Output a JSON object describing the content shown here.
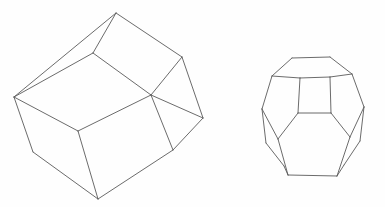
{
  "figure": {
    "title": "Two wireframe polyhedra line drawing",
    "background_color": "#fefefe",
    "stroke_color": "#5a5a5a",
    "stroke_width": 0.9,
    "width": 385,
    "height": 207,
    "shape_count": 2
  },
  "shapes": [
    {
      "id": "left-polyhedron",
      "name": "truncated-cube-wireframe",
      "label": "Left polyhedron",
      "description": "Large tilted truncated-cube / rhombic solid seen in three-quarter view",
      "bounds": {
        "x": 12,
        "y": 11,
        "width": 195,
        "height": 190
      },
      "face_count_visible": 6,
      "vertices": [
        {
          "id": "v-apex-top",
          "x": 116,
          "y": 13
        },
        {
          "id": "v-left-upper",
          "x": 14,
          "y": 97
        },
        {
          "id": "v-upper-mid",
          "x": 93,
          "y": 53
        },
        {
          "id": "v-right-upper",
          "x": 182,
          "y": 57
        },
        {
          "id": "v-center",
          "x": 151,
          "y": 95
        },
        {
          "id": "v-right-lower",
          "x": 203,
          "y": 118
        },
        {
          "id": "v-left-lower",
          "x": 33,
          "y": 152
        },
        {
          "id": "v-bottom-apex",
          "x": 98,
          "y": 199
        },
        {
          "id": "v-right-bottom",
          "x": 173,
          "y": 150
        },
        {
          "id": "v-inner-left",
          "x": 78,
          "y": 131
        }
      ],
      "faces": [
        {
          "id": "face-top-small",
          "name": "top-triangular-face",
          "path": "M 116 13 L 93 53 L 14 97 L 116 13 Z"
        },
        {
          "id": "face-top-large",
          "name": "top-rhombic-face",
          "path": "M 116 13 L 182 57 L 151 95 L 93 53 Z"
        },
        {
          "id": "face-left",
          "name": "left-rhombic-face",
          "path": "M 14 97 L 93 53 L 151 95 L 78 131 Z"
        },
        {
          "id": "face-front-left",
          "name": "front-left-face",
          "path": "M 14 97 L 78 131 L 98 199 L 33 152 Z"
        },
        {
          "id": "face-front-right",
          "name": "front-right-face",
          "path": "M 78 131 L 151 95 L 173 150 L 98 199 Z"
        },
        {
          "id": "face-right",
          "name": "right-rhombic-face",
          "path": "M 151 95 L 182 57 L 203 118 L 173 150 Z"
        }
      ],
      "edges": [
        {
          "from": "v-apex-top",
          "to": "v-upper-mid"
        },
        {
          "from": "v-apex-top",
          "to": "v-left-upper"
        },
        {
          "from": "v-apex-top",
          "to": "v-right-upper"
        },
        {
          "from": "v-upper-mid",
          "to": "v-left-upper"
        },
        {
          "from": "v-upper-mid",
          "to": "v-center"
        },
        {
          "from": "v-right-upper",
          "to": "v-center"
        },
        {
          "from": "v-right-upper",
          "to": "v-right-lower"
        },
        {
          "from": "v-center",
          "to": "v-right-lower"
        },
        {
          "from": "v-center",
          "to": "v-inner-left"
        },
        {
          "from": "v-left-upper",
          "to": "v-inner-left"
        },
        {
          "from": "v-left-upper",
          "to": "v-left-lower"
        },
        {
          "from": "v-inner-left",
          "to": "v-bottom-apex"
        },
        {
          "from": "v-left-lower",
          "to": "v-bottom-apex"
        },
        {
          "from": "v-bottom-apex",
          "to": "v-right-bottom"
        },
        {
          "from": "v-right-bottom",
          "to": "v-center"
        },
        {
          "from": "v-right-bottom",
          "to": "v-right-lower"
        }
      ]
    },
    {
      "id": "right-polyhedron",
      "name": "truncated-octahedron-wireframe",
      "label": "Right polyhedron",
      "description": "Smaller rounded truncated octahedron with top hexagonal face and front square face",
      "bounds": {
        "x": 260,
        "y": 54,
        "width": 106,
        "height": 126
      },
      "face_count_visible": 9,
      "vertices": [
        {
          "id": "r-top-left",
          "x": 292,
          "y": 58
        },
        {
          "id": "r-top-right",
          "x": 330,
          "y": 57
        },
        {
          "id": "r-top-far-right",
          "x": 352,
          "y": 74
        },
        {
          "id": "r-top-far-left",
          "x": 272,
          "y": 76
        },
        {
          "id": "r-sq-tl",
          "x": 300,
          "y": 78
        },
        {
          "id": "r-sq-tr",
          "x": 330,
          "y": 77
        },
        {
          "id": "r-sq-br",
          "x": 331,
          "y": 113
        },
        {
          "id": "r-sq-bl",
          "x": 298,
          "y": 113
        },
        {
          "id": "r-left-mid",
          "x": 262,
          "y": 109
        },
        {
          "id": "r-right-mid",
          "x": 364,
          "y": 107
        },
        {
          "id": "r-left-low",
          "x": 266,
          "y": 143
        },
        {
          "id": "r-right-low",
          "x": 360,
          "y": 141
        },
        {
          "id": "r-front-left",
          "x": 278,
          "y": 139
        },
        {
          "id": "r-front-right",
          "x": 350,
          "y": 137
        },
        {
          "id": "r-bot-left",
          "x": 288,
          "y": 175
        },
        {
          "id": "r-bot-right",
          "x": 337,
          "y": 176
        },
        {
          "id": "r-bot-far-left",
          "x": 284,
          "y": 166
        },
        {
          "id": "r-bot-far-right",
          "x": 344,
          "y": 165
        }
      ],
      "faces": [
        {
          "id": "r-face-top",
          "name": "top-hexagonal-face",
          "path": "M 292 58 L 330 57 L 352 74 L 330 77 L 300 78 L 272 76 Z"
        },
        {
          "id": "r-face-square",
          "name": "front-square-face",
          "path": "M 300 78 L 330 77 L 331 113 L 298 113 Z"
        },
        {
          "id": "r-face-front-hex",
          "name": "front-hexagonal-face",
          "path": "M 298 113 L 331 113 L 350 137 L 337 176 L 288 175 L 278 139 Z"
        },
        {
          "id": "r-face-left-hex",
          "name": "left-hexagonal-face",
          "path": "M 272 76 L 300 78 L 298 113 L 278 139 L 262 109 Z"
        },
        {
          "id": "r-face-right-hex",
          "name": "right-hexagonal-face",
          "path": "M 330 77 L 352 74 L 364 107 L 350 137 L 331 113 Z"
        },
        {
          "id": "r-face-lower-left",
          "name": "lower-left-pentagonal-face",
          "path": "M 262 109 L 278 139 L 288 175 L 284 166 L 266 143 Z"
        },
        {
          "id": "r-face-lower-right",
          "name": "lower-right-pentagonal-face",
          "path": "M 364 107 L 360 141 L 344 165 L 337 176 L 350 137 Z"
        }
      ],
      "edges": [
        {
          "from": "r-top-left",
          "to": "r-top-right"
        },
        {
          "from": "r-top-right",
          "to": "r-top-far-right"
        },
        {
          "from": "r-top-far-right",
          "to": "r-sq-tr"
        },
        {
          "from": "r-sq-tr",
          "to": "r-sq-tl"
        },
        {
          "from": "r-sq-tl",
          "to": "r-top-far-left"
        },
        {
          "from": "r-top-far-left",
          "to": "r-top-left"
        },
        {
          "from": "r-sq-tl",
          "to": "r-sq-bl"
        },
        {
          "from": "r-sq-tr",
          "to": "r-sq-br"
        },
        {
          "from": "r-sq-bl",
          "to": "r-sq-br"
        },
        {
          "from": "r-top-far-left",
          "to": "r-left-mid"
        },
        {
          "from": "r-top-far-right",
          "to": "r-right-mid"
        },
        {
          "from": "r-left-mid",
          "to": "r-front-left"
        },
        {
          "from": "r-right-mid",
          "to": "r-front-right"
        },
        {
          "from": "r-sq-bl",
          "to": "r-front-left"
        },
        {
          "from": "r-sq-br",
          "to": "r-front-right"
        },
        {
          "from": "r-front-left",
          "to": "r-bot-left"
        },
        {
          "from": "r-front-right",
          "to": "r-bot-right"
        },
        {
          "from": "r-bot-left",
          "to": "r-bot-right"
        },
        {
          "from": "r-left-mid",
          "to": "r-left-low"
        },
        {
          "from": "r-right-mid",
          "to": "r-right-low"
        },
        {
          "from": "r-left-low",
          "to": "r-bot-far-left"
        },
        {
          "from": "r-right-low",
          "to": "r-bot-far-right"
        },
        {
          "from": "r-bot-far-left",
          "to": "r-bot-left"
        },
        {
          "from": "r-bot-far-right",
          "to": "r-bot-right"
        }
      ]
    }
  ]
}
